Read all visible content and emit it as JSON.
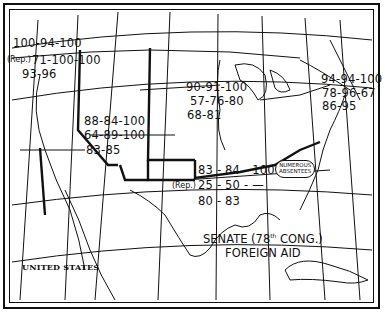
{
  "map": {
    "title_line1": "SENATE (78th CONG.)",
    "title_line1_main": "SENATE (78",
    "title_line1_sup": "th",
    "title_line1_end": " CONG.)",
    "title_line2": "FOREIGN AID",
    "country_label": "UNITED STATES",
    "regions": [
      {
        "name": "pacific-northwest",
        "lines": [
          "100-94-100",
          "71-100-100",
          "93-96"
        ],
        "rep_marker": "(Rep.)"
      },
      {
        "name": "mountain-west",
        "lines": [
          "88-84-100",
          "64-89-100",
          "83-85"
        ]
      },
      {
        "name": "midwest",
        "lines": [
          "90-91-100",
          "57-76-80",
          "68-81"
        ]
      },
      {
        "name": "northeast",
        "lines": [
          "94-94-100",
          "78-96-67",
          "86-95"
        ]
      },
      {
        "name": "south",
        "lines": [
          "83 - 84 - 100",
          "25 - 50 - —",
          "80 - 83"
        ],
        "rep_marker": "(Rep.)",
        "note_line1": "NUMEROUS",
        "note_line2": "ABSENTEES"
      }
    ]
  }
}
